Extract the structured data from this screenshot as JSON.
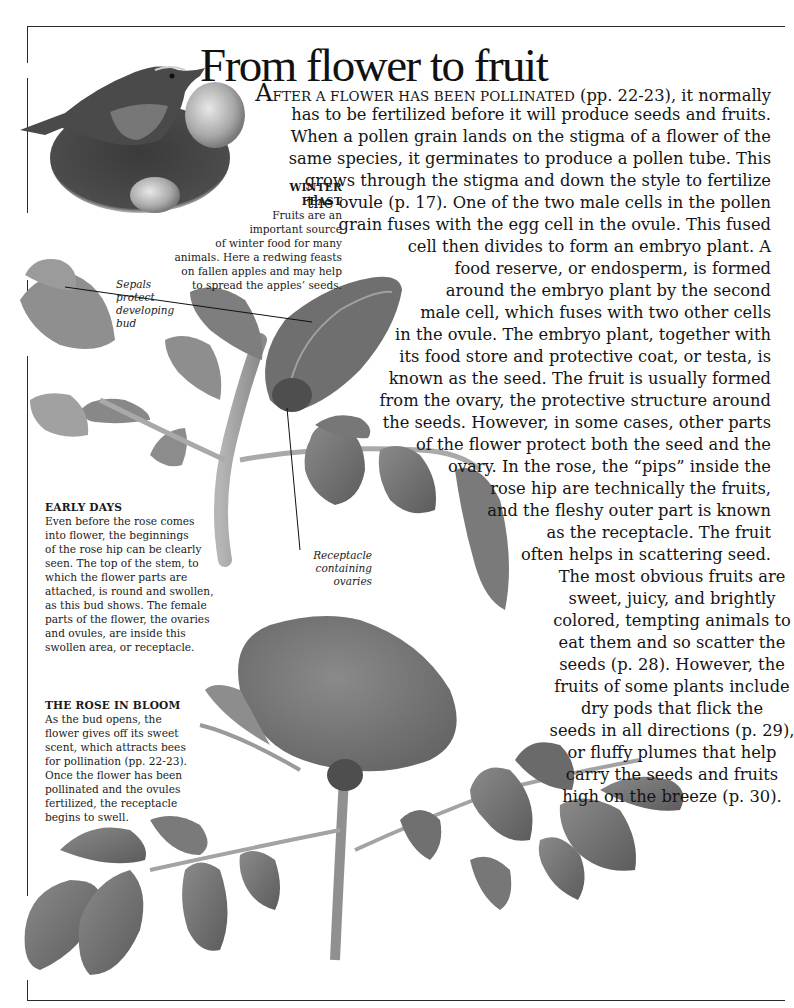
{
  "page": {
    "title": "From flower to fruit",
    "colors": {
      "background": "#ffffff",
      "text": "#141414",
      "rule": "#2a2a2a",
      "foliage_dark": "#5e5e5e",
      "foliage_mid": "#7d7d7d",
      "foliage_light": "#a6a6a6"
    }
  },
  "main_text": {
    "dropcap": "A",
    "smallcaps_lead": "FTER A FLOWER HAS BEEN POLLINATED",
    "lines": [
      " (pp. 22-23), it normally",
      "has to be fertilized before it will produce seeds and fruits.",
      "When a pollen grain lands on the stigma of a flower of the",
      "same species, it germinates to produce a pollen tube. This",
      "grows through the stigma and down the style to fertilize",
      "the ovule (p. 17). One of the two male cells in the pollen",
      "grain fuses with the egg cell in the ovule. This fused",
      "cell then divides to form an embryo plant. A",
      "food reserve, or endosperm, is formed",
      "around the embryo plant by the second",
      "male cell, which fuses with two other cells",
      "in the ovule. The embryo plant, together with",
      "its food store and protective coat, or testa, is",
      "known as the seed. The fruit is usually formed",
      "from the ovary, the protective structure around",
      "the seeds. However, in some cases, other parts",
      "of the flower protect both the seed and the",
      "ovary. In the rose, the “pips” inside the",
      "rose hip are technically the fruits,",
      "and the fleshy outer part is known",
      "as the receptacle. The fruit",
      "often helps in scattering seed.",
      "The most obvious fruits are",
      "sweet, juicy, and brightly",
      "colored, tempting animals to",
      "eat them and so scatter the",
      "seeds (p. 28). However, the",
      "fruits of some plants include",
      "dry pods that flick the",
      "seeds in all directions (p. 29),",
      "or fluffy plumes that help",
      "carry the seeds and fruits",
      "high on the breeze (p. 30)."
    ]
  },
  "captions": {
    "winter_feast": {
      "title_line1": "WINTER",
      "title_line2": "FEAST",
      "lines": [
        "Fruits are an",
        "important source",
        "of winter food for many",
        "animals. Here a redwing feasts",
        "on fallen apples and may help",
        "to spread the apples’ seeds."
      ]
    },
    "early_days": {
      "title": "EARLY DAYS",
      "lines": [
        "Even before the rose comes",
        "into flower, the beginnings",
        "of the rose hip can be clearly",
        "seen. The top of the stem, to",
        "which the flower parts are",
        "attached, is round and swollen,",
        "as this bud shows. The female",
        "parts of the flower, the ovaries",
        "and ovules, are inside this",
        "swollen area, or receptacle."
      ]
    },
    "rose_in_bloom": {
      "title": "THE ROSE IN BLOOM",
      "lines": [
        "As the bud opens, the",
        "flower gives off its sweet",
        "scent, which attracts bees",
        "for pollination (pp. 22-23).",
        "Once the flower has been",
        "pollinated and the ovules",
        "fertilized, the receptacle",
        "begins to swell."
      ]
    }
  },
  "labels": {
    "sepals": [
      "Sepals",
      "protect",
      "developing",
      "bud"
    ],
    "receptacle": [
      "Receptacle",
      "containing",
      "ovaries"
    ]
  },
  "illustrations": {
    "bird": "redwing-on-apples",
    "bud": "rose-bud-stem",
    "bloom": "rose-in-bloom"
  }
}
